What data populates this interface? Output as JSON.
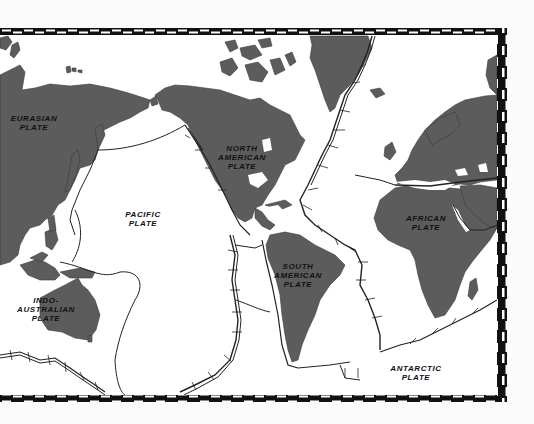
{
  "map": {
    "title": "Tectonic Plates World Map",
    "colors": {
      "land": "#5c5c5c",
      "ocean": "#ffffff",
      "border_dark": "#111111",
      "border_light": "#ffffff",
      "boundary": "#222222",
      "background": "#fbfbfb"
    },
    "plates": [
      {
        "id": "eurasian",
        "label": "EURASIAN\nPLATE"
      },
      {
        "id": "north-american",
        "label": "NORTH\nAMERICAN\nPLATE"
      },
      {
        "id": "pacific",
        "label": "PACIFIC\nPLATE"
      },
      {
        "id": "african",
        "label": "AFRICAN\nPLATE"
      },
      {
        "id": "south-american",
        "label": "SOUTH\nAMERICAN\nPLATE"
      },
      {
        "id": "indo-australian",
        "label": "INDO-\nAUSTRALIAN\nPLATE"
      },
      {
        "id": "antarctic",
        "label": "ANTARCTIC\nPLATE"
      }
    ],
    "legend": null
  }
}
